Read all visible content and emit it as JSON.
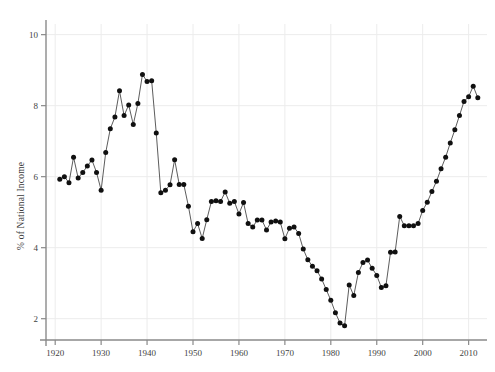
{
  "chart_data": {
    "type": "line",
    "title": "",
    "xlabel": "",
    "ylabel": "% of National Income",
    "xlim": [
      1918,
      2014
    ],
    "ylim": [
      1.4,
      10.3
    ],
    "xticks": [
      1920,
      1930,
      1940,
      1950,
      1960,
      1970,
      1980,
      1990,
      2000,
      2010
    ],
    "yticks": [
      2,
      4,
      6,
      8,
      10
    ],
    "xtick_labels": [
      "1920",
      "1930",
      "1940",
      "1950",
      "1960",
      "1970",
      "1980",
      "1990",
      "2000",
      "2010"
    ],
    "ytick_labels": [
      "2",
      "4",
      "6",
      "8",
      "10"
    ],
    "grid": true,
    "legend": null,
    "marker": "filled-circle",
    "marker_color": "#101010",
    "line_color": "#4a4a4a",
    "grid_color": "#ececec",
    "axis_color": "#8a8a8a",
    "background": "#ffffff",
    "x": [
      1921,
      1922,
      1923,
      1924,
      1925,
      1926,
      1927,
      1928,
      1929,
      1930,
      1931,
      1932,
      1933,
      1934,
      1935,
      1936,
      1937,
      1938,
      1939,
      1940,
      1941,
      1942,
      1943,
      1944,
      1945,
      1946,
      1947,
      1948,
      1949,
      1950,
      1951,
      1952,
      1953,
      1954,
      1955,
      1956,
      1957,
      1958,
      1959,
      1960,
      1961,
      1962,
      1963,
      1964,
      1965,
      1966,
      1967,
      1968,
      1969,
      1970,
      1971,
      1972,
      1973,
      1974,
      1975,
      1976,
      1977,
      1978,
      1979,
      1980,
      1981,
      1982,
      1983,
      1984,
      1985,
      1986,
      1987,
      1988,
      1989,
      1990,
      1991,
      1992,
      1993,
      1994,
      1995,
      1996,
      1997,
      1998,
      1999,
      2000,
      2001,
      2002,
      2003,
      2004,
      2005,
      2006,
      2007,
      2008,
      2009,
      2010,
      2011,
      2012
    ],
    "y": [
      5.93,
      6.0,
      5.83,
      6.55,
      5.96,
      6.12,
      6.3,
      6.47,
      6.12,
      5.62,
      6.68,
      7.35,
      7.68,
      8.42,
      7.72,
      8.02,
      7.47,
      8.06,
      8.88,
      8.68,
      8.7,
      7.23,
      5.55,
      5.62,
      5.77,
      6.48,
      5.78,
      5.78,
      5.17,
      4.45,
      4.68,
      4.26,
      4.79,
      5.3,
      5.32,
      5.3,
      5.57,
      5.25,
      5.3,
      4.95,
      5.27,
      4.68,
      4.58,
      4.78,
      4.78,
      4.5,
      4.72,
      4.75,
      4.72,
      4.25,
      4.55,
      4.58,
      4.4,
      3.96,
      3.66,
      3.48,
      3.35,
      3.12,
      2.82,
      2.52,
      2.17,
      1.88,
      1.8,
      2.95,
      2.65,
      3.3,
      3.58,
      3.65,
      3.42,
      3.22,
      2.88,
      2.93,
      3.87,
      3.88,
      4.88,
      4.62,
      4.62,
      4.62,
      4.68,
      5.05,
      5.28,
      5.58,
      5.87,
      6.22,
      6.55,
      6.95,
      7.32,
      7.72,
      8.12,
      8.25,
      8.55,
      8.22
    ]
  }
}
